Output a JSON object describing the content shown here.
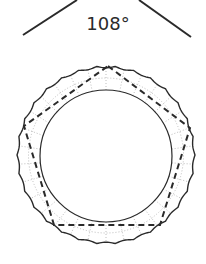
{
  "diagram": {
    "angle_label": "108°",
    "angle_vertex_lines": {
      "left": {
        "x1": 23,
        "y1": 35,
        "x2": 77,
        "y2": 0
      },
      "right": {
        "x1": 139,
        "y1": 0,
        "x2": 191,
        "y2": 37
      }
    },
    "ring": {
      "outer": {
        "cx": 106,
        "cy": 155,
        "r": 89,
        "style": "wavy"
      },
      "inner": {
        "cx": 106,
        "cy": 156,
        "r": 66
      }
    },
    "pentagon": {
      "style": "dashed",
      "vertices": [
        [
          108,
          66
        ],
        [
          190,
          128
        ],
        [
          160,
          225
        ],
        [
          54,
          225
        ],
        [
          24,
          126
        ]
      ]
    },
    "colors": {
      "stroke": "#2a2a2a",
      "dotted": "#bdbdbd",
      "background": "#ffffff"
    }
  }
}
